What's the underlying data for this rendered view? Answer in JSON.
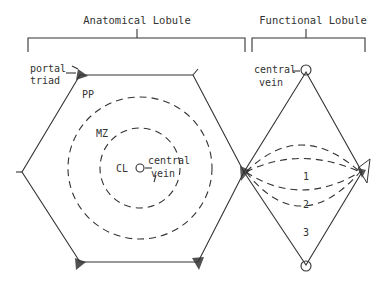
{
  "titles": {
    "anatomical": "Anatomical Lobule",
    "functional": "Functional Lobule"
  },
  "anatomical_labels": {
    "portal_triad_line1": "portal",
    "portal_triad_line2": "triad",
    "pp": "PP",
    "mz": "MZ",
    "cl": "CL",
    "central_vein_line1": "central",
    "central_vein_line2": "vein"
  },
  "functional_labels": {
    "central_vein_line1": "central",
    "central_vein_line2": "vein",
    "zone1": "1",
    "zone2": "2",
    "zone3": "3"
  },
  "colors": {
    "line": "#333333",
    "background": "#ffffff"
  }
}
